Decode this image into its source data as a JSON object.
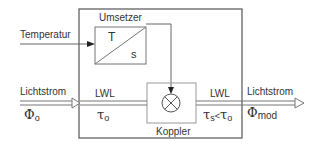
{
  "diagram": {
    "outer_box": {},
    "converter": {
      "title": "Umsetzer",
      "top_left_symbol": "T",
      "bottom_right_symbol": "s"
    },
    "coupler": {
      "title": "Koppler",
      "symbol": "⊗"
    },
    "input_temperature": {
      "label": "Temperatur"
    },
    "input_light": {
      "label": "Lichtstrom",
      "symbol": "Φ",
      "subscript": "o"
    },
    "fiber_in": {
      "label": "LWL",
      "symbol": "τ",
      "subscript": "o"
    },
    "fiber_out": {
      "label": "LWL",
      "symbol_left": "τ",
      "subscript_left": "s",
      "relation": "<",
      "symbol_right": "τ",
      "subscript_right": "o"
    },
    "output_light": {
      "label": "Lichtstrom",
      "symbol": "Φ",
      "subscript": "mod"
    },
    "colors": {
      "line": "#555555",
      "text": "#333333",
      "inner_box": "#999999"
    }
  }
}
